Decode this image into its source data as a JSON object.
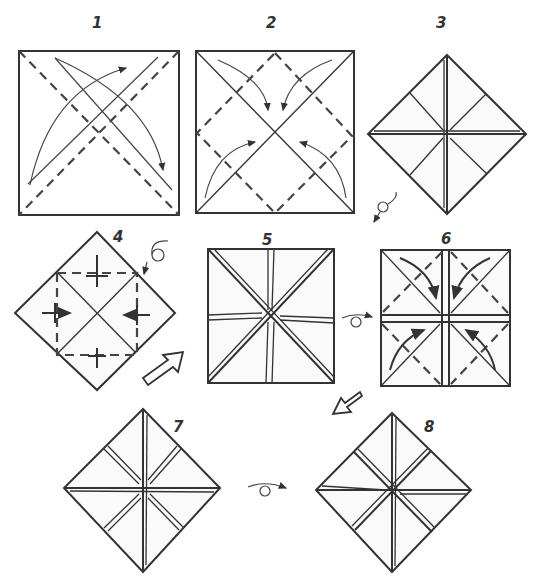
{
  "diagram": {
    "steps": [
      {
        "id": 1,
        "label": "1",
        "description": "Square sheet; fold both diagonals (valley), arrows indicate corner-to-corner folds"
      },
      {
        "id": 2,
        "label": "2",
        "description": "Fold all four corners to the centre (blintz), dashed square shows fold lines"
      },
      {
        "id": 3,
        "label": "3",
        "description": "Blintzed square shown as diamond; turn over"
      },
      {
        "id": 4,
        "label": "4",
        "description": "Fold corners to centre again on reverse side; turn over"
      },
      {
        "id": 5,
        "label": "5",
        "description": "Result after second blintz; turn over"
      },
      {
        "id": 6,
        "label": "6",
        "description": "Fold flaps along dashed diagonals"
      },
      {
        "id": 7,
        "label": "7",
        "description": "Result shown as diamond; turn over"
      },
      {
        "id": 8,
        "label": "8",
        "description": "Finished model"
      }
    ],
    "symbols": {
      "turn_over": "loop arrow (turn over)",
      "next_step": "hollow arrow"
    }
  }
}
